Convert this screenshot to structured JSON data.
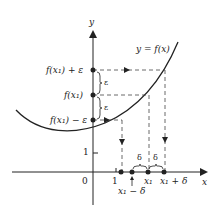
{
  "diagram": {
    "axes": {
      "x_label": "x",
      "y_label": "y",
      "origin_label": "0",
      "x_tick_label": "1",
      "y_tick_label": "1"
    },
    "curve_label": "y = f(x)",
    "y_axis_points": {
      "upper": "f(x₁) + ε",
      "middle": "f(x₁)",
      "lower": "f(x₁) − ε"
    },
    "epsilon_labels": [
      "ε",
      "ε"
    ],
    "x_axis_points": {
      "left": "x₁ − δ",
      "middle": "x₁",
      "right": "x₁ + δ"
    },
    "delta_labels": [
      "δ",
      "δ"
    ],
    "colors": {
      "ink": "#222222",
      "dashed": "#444444"
    }
  }
}
